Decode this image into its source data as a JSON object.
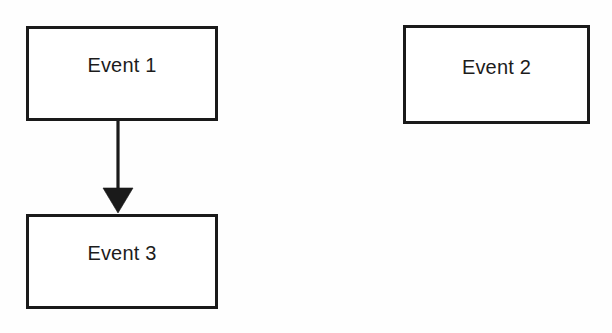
{
  "diagram": {
    "type": "flowchart",
    "background_color": "#ffffff",
    "stroke_color": "#1a1a1a",
    "text_color": "#1c1c1c",
    "nodes": [
      {
        "id": "event-1",
        "label": "Event 1",
        "shape": "rectangle"
      },
      {
        "id": "event-2",
        "label": "Event 2",
        "shape": "rectangle"
      },
      {
        "id": "event-3",
        "label": "Event 3",
        "shape": "rectangle"
      }
    ],
    "edges": [
      {
        "id": "edge-event-1-to-event-3",
        "from": "event-1",
        "to": "event-3",
        "label": "",
        "arrowhead": "filled-triangle",
        "direction": "down"
      }
    ]
  }
}
